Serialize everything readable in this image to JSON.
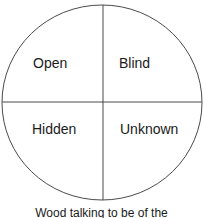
{
  "diagram": {
    "type": "johari-window",
    "quadrants": [
      {
        "label": "Open"
      },
      {
        "label": "Blind"
      },
      {
        "label": "Hidden"
      },
      {
        "label": "Unknown"
      }
    ],
    "caption": "Wood talking to be of the"
  }
}
